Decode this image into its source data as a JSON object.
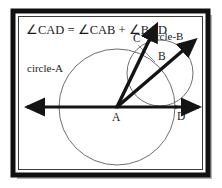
{
  "figure": {
    "title_equation": "∠CAD = ∠CAB + ∠BAD",
    "equation_parts": {
      "left": "∠CAD",
      "equals": "=",
      "term1": "∠CAB",
      "plus": "+",
      "term2": "∠BAD"
    },
    "labels": {
      "circle_a": "circle-A",
      "circle_b": "circle-B",
      "point_a": "A",
      "point_b": "B",
      "point_c": "C",
      "point_d": "D"
    },
    "colors": {
      "ink": "#1a1a1a",
      "ray": "#141414",
      "circle_stroke": "#6e6e6e",
      "frame_dark": "#101010",
      "frame_mid": "#5a5a5a",
      "frame_shadow": "#b4b4b4",
      "background": "#ffffff"
    },
    "frame": {
      "outer": {
        "x": 13,
        "y": 11,
        "width": 195,
        "height": 164
      },
      "shadow_offset": 4
    },
    "geometry": {
      "circle_a": {
        "cx": 117,
        "cy": 107,
        "r": 58,
        "label_pos": {
          "x": 30,
          "y": 70
        }
      },
      "circle_b": {
        "cx": 160,
        "cy": 73,
        "r": 33,
        "label_pos": {
          "x": 150,
          "y": 38
        }
      },
      "points": [
        {
          "id": "A",
          "x": 117,
          "y": 107,
          "label_dx": -4,
          "label_dy": 12
        },
        {
          "id": "B",
          "x": 155,
          "y": 62,
          "label_dx": 4,
          "label_dy": -3
        },
        {
          "id": "C",
          "x": 138,
          "y": 45,
          "label_dx": -3,
          "label_dy": -4
        },
        {
          "id": "D",
          "x": 176,
          "y": 107,
          "label_dx": 2,
          "label_dy": 12
        }
      ],
      "horizontal_line": {
        "x1": 25,
        "y1": 107,
        "x2": 201,
        "y2": 107,
        "arrows": "both"
      },
      "ray_ac": {
        "x1": 117,
        "y1": 107,
        "x2": 158,
        "y2": 22,
        "arrow": "end"
      },
      "ray_ab": {
        "x1": 117,
        "y1": 107,
        "x2": 197,
        "y2": 38,
        "arrow": "end"
      },
      "chord_cb": {
        "x1": 138,
        "y1": 45,
        "x2": 155,
        "y2": 62
      }
    }
  }
}
